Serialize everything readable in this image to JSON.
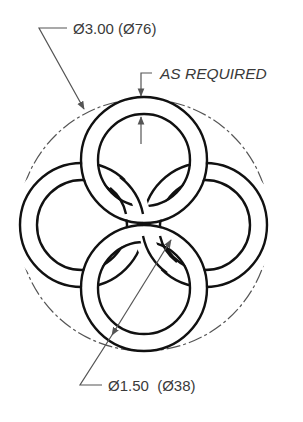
{
  "drawing": {
    "type": "technical-drawing",
    "subject": "four interlocking rings inside a circle",
    "colors": {
      "line": "#111111",
      "dimension": "#555555",
      "background": "#ffffff"
    },
    "outer_circle": {
      "cx": 144,
      "cy": 225,
      "r": 126,
      "style": "phantom-dashed"
    },
    "rings": [
      {
        "name": "top",
        "cx": 144,
        "cy": 160,
        "r_outer": 63,
        "r_inner": 46
      },
      {
        "name": "left",
        "cx": 82,
        "cy": 225,
        "r_outer": 62,
        "r_inner": 45
      },
      {
        "name": "right",
        "cx": 205,
        "cy": 225,
        "r_outer": 62,
        "r_inner": 45
      },
      {
        "name": "bottom",
        "cx": 144,
        "cy": 288,
        "r_outer": 63,
        "r_inner": 46
      }
    ]
  },
  "annotations": {
    "outer_diameter": "Ø3.00 (Ø76)",
    "clearance": "AS REQUIRED",
    "ring_diameter": "Ø1.50  (Ø38)"
  }
}
